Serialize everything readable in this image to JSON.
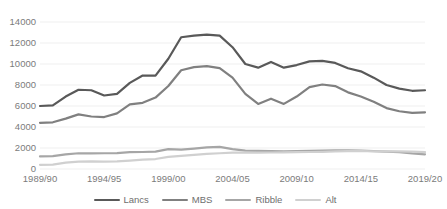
{
  "chart_data": {
    "type": "line",
    "title": "",
    "xlabel": "",
    "ylabel": "",
    "ylim": [
      0,
      14000
    ],
    "ytick_labels": [
      "14000",
      "12000",
      "10000",
      "8000",
      "6000",
      "4000",
      "2000",
      "0"
    ],
    "ytick_values": [
      14000,
      12000,
      10000,
      8000,
      6000,
      4000,
      2000,
      0
    ],
    "grid": true,
    "legend_position": "bottom",
    "x": [
      "1989/90",
      "1990/91",
      "1991/92",
      "1992/93",
      "1993/94",
      "1994/95",
      "1995/96",
      "1996/97",
      "1997/98",
      "1998/99",
      "1999/00",
      "2000/01",
      "2001/02",
      "2002/03",
      "2003/04",
      "2004/05",
      "2005/06",
      "2006/07",
      "2007/08",
      "2008/09",
      "2009/10",
      "2010/11",
      "2011/12",
      "2012/13",
      "2013/14",
      "2014/15",
      "2015/16",
      "2016/17",
      "2017/18",
      "2018/19",
      "2019/20"
    ],
    "xtick_labels": [
      "1989/90",
      "1994/95",
      "1999/00",
      "2004/05",
      "2009/10",
      "2014/15",
      "2019/20"
    ],
    "xtick_indices": [
      0,
      5,
      10,
      15,
      20,
      25,
      30
    ],
    "series": [
      {
        "name": "Lancs",
        "color": "#595959",
        "values": [
          6000,
          6050,
          6900,
          7550,
          7500,
          7000,
          7150,
          8200,
          8900,
          8900,
          10500,
          12550,
          12700,
          12800,
          12700,
          11600,
          10000,
          9650,
          10200,
          9650,
          9900,
          10250,
          10300,
          10100,
          9600,
          9300,
          8700,
          8000,
          7650,
          7450,
          7500
        ]
      },
      {
        "name": "MBS",
        "color": "#808080",
        "values": [
          4400,
          4450,
          4800,
          5200,
          5000,
          4950,
          5300,
          6150,
          6300,
          6800,
          7900,
          9400,
          9700,
          9800,
          9600,
          8700,
          7150,
          6200,
          6700,
          6200,
          6900,
          7800,
          8050,
          7900,
          7300,
          6900,
          6400,
          5800,
          5500,
          5350,
          5400
        ]
      },
      {
        "name": "Ribble",
        "color": "#a6a6a6",
        "values": [
          1200,
          1220,
          1400,
          1500,
          1480,
          1500,
          1520,
          1600,
          1620,
          1650,
          1900,
          1850,
          1950,
          2050,
          2100,
          1900,
          1750,
          1720,
          1700,
          1680,
          1700,
          1720,
          1750,
          1780,
          1780,
          1750,
          1700,
          1650,
          1600,
          1480,
          1400
        ]
      },
      {
        "name": "Alt",
        "color": "#d0d0d0",
        "values": [
          400,
          420,
          600,
          700,
          720,
          700,
          720,
          800,
          900,
          950,
          1150,
          1250,
          1350,
          1450,
          1500,
          1550,
          1560,
          1560,
          1570,
          1580,
          1600,
          1620,
          1640,
          1680,
          1700,
          1700,
          1690,
          1680,
          1670,
          1650,
          1600
        ]
      }
    ]
  },
  "legend": {
    "items": [
      {
        "label": "Lancs"
      },
      {
        "label": "MBS"
      },
      {
        "label": "Ribble"
      },
      {
        "label": "Alt"
      }
    ]
  },
  "colors": {
    "background": "#ffffff",
    "gridline": "#efefef",
    "tick_text": "#7b7b7b"
  }
}
